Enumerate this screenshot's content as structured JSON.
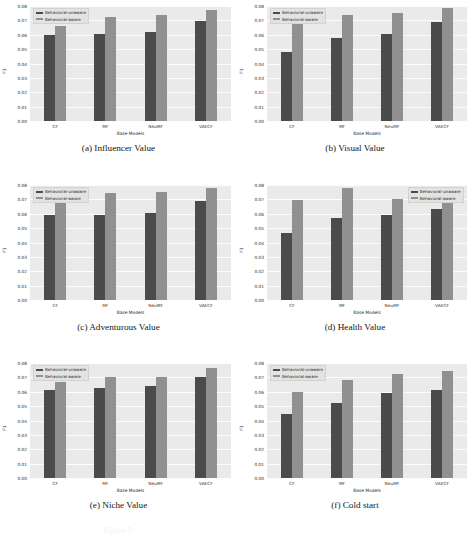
{
  "figure": {
    "panel_count": 6,
    "ghost_caption": "Figure 5:"
  },
  "chart_data": [
    {
      "type": "bar",
      "panel": "a",
      "title": "(a) Influencer Value",
      "xlabel": "Base Models",
      "ylabel": "F1",
      "categories": [
        "CF",
        "MF",
        "NeuMF",
        "VAECF"
      ],
      "ylim": [
        0.0,
        0.08
      ],
      "yticks": [
        "0.00",
        "0.01",
        "0.02",
        "0.03",
        "0.04",
        "0.05",
        "0.06",
        "0.07",
        "0.08"
      ],
      "grid": true,
      "legend_position": "upper left",
      "series": [
        {
          "name": "Behavioral-unaware",
          "color": "#4b4b4b",
          "values": [
            0.06,
            0.0608,
            0.0618,
            0.0697
          ]
        },
        {
          "name": "Behavioral-aware",
          "color": "#909090",
          "values": [
            0.0662,
            0.0727,
            0.074,
            0.0772
          ]
        }
      ]
    },
    {
      "type": "bar",
      "panel": "b",
      "title": "(b) Visual Value",
      "xlabel": "Base Models",
      "ylabel": "F1",
      "categories": [
        "CF",
        "MF",
        "NeuMF",
        "VAECF"
      ],
      "ylim": [
        0.0,
        0.08
      ],
      "yticks": [
        "0.00",
        "0.01",
        "0.02",
        "0.03",
        "0.04",
        "0.05",
        "0.06",
        "0.07",
        "0.08"
      ],
      "grid": true,
      "legend_position": "upper left",
      "series": [
        {
          "name": "Behavioral-unaware",
          "color": "#4b4b4b",
          "values": [
            0.048,
            0.0575,
            0.0608,
            0.0688
          ]
        },
        {
          "name": "Behavioral-aware",
          "color": "#909090",
          "values": [
            0.069,
            0.0735,
            0.075,
            0.0785
          ]
        }
      ]
    },
    {
      "type": "bar",
      "panel": "c",
      "title": "(c) Adventurous Value",
      "xlabel": "Base Models",
      "ylabel": "F1",
      "categories": [
        "CF",
        "MF",
        "NeuMF",
        "VAECF"
      ],
      "ylim": [
        0.0,
        0.08
      ],
      "yticks": [
        "0.00",
        "0.01",
        "0.02",
        "0.03",
        "0.04",
        "0.05",
        "0.06",
        "0.07",
        "0.08"
      ],
      "grid": true,
      "legend_position": "upper left",
      "series": [
        {
          "name": "Behavioral-unaware",
          "color": "#4b4b4b",
          "values": [
            0.0588,
            0.0594,
            0.0608,
            0.0692
          ]
        },
        {
          "name": "Behavioral-aware",
          "color": "#909090",
          "values": [
            0.0682,
            0.0742,
            0.0752,
            0.0782
          ]
        }
      ]
    },
    {
      "type": "bar",
      "panel": "d",
      "title": "(d) Health Value",
      "xlabel": "Base Models",
      "ylabel": "F1",
      "categories": [
        "CF",
        "MF",
        "NeuMF",
        "VAECF"
      ],
      "ylim": [
        0.0,
        0.08
      ],
      "yticks": [
        "0.00",
        "0.01",
        "0.02",
        "0.03",
        "0.04",
        "0.05",
        "0.06",
        "0.07",
        "0.08"
      ],
      "grid": true,
      "legend_position": "upper right",
      "series": [
        {
          "name": "Behavioral-unaware",
          "color": "#4b4b4b",
          "values": [
            0.0465,
            0.0572,
            0.0594,
            0.0635
          ]
        },
        {
          "name": "Behavioral-aware",
          "color": "#909090",
          "values": [
            0.0697,
            0.0778,
            0.07,
            0.0698
          ]
        }
      ]
    },
    {
      "type": "bar",
      "panel": "e",
      "title": "(e) Niche Value",
      "xlabel": "Base Models",
      "ylabel": "F1",
      "categories": [
        "CF",
        "MF",
        "NeuMF",
        "VAECF"
      ],
      "ylim": [
        0.0,
        0.08
      ],
      "yticks": [
        "0.00",
        "0.01",
        "0.02",
        "0.03",
        "0.04",
        "0.05",
        "0.06",
        "0.07",
        "0.08"
      ],
      "grid": true,
      "legend_position": "upper left",
      "series": [
        {
          "name": "Behavioral-unaware",
          "color": "#4b4b4b",
          "values": [
            0.0612,
            0.0625,
            0.0638,
            0.0705
          ]
        },
        {
          "name": "Behavioral-aware",
          "color": "#909090",
          "values": [
            0.0665,
            0.07,
            0.0702,
            0.0768
          ]
        }
      ]
    },
    {
      "type": "bar",
      "panel": "f",
      "title": "(f) Cold start",
      "xlabel": "Base Models",
      "ylabel": "F1",
      "categories": [
        "CF",
        "MF",
        "NeuMF",
        "VAECF"
      ],
      "ylim": [
        0.0,
        0.08
      ],
      "yticks": [
        "0.00",
        "0.01",
        "0.02",
        "0.03",
        "0.04",
        "0.05",
        "0.06",
        "0.07",
        "0.08"
      ],
      "grid": true,
      "legend_position": "upper left",
      "series": [
        {
          "name": "Behavioral-unaware",
          "color": "#4b4b4b",
          "values": [
            0.0448,
            0.0525,
            0.0588,
            0.0615
          ]
        },
        {
          "name": "Behavioral-aware",
          "color": "#909090",
          "values": [
            0.06,
            0.068,
            0.0722,
            0.0742
          ]
        }
      ]
    }
  ]
}
